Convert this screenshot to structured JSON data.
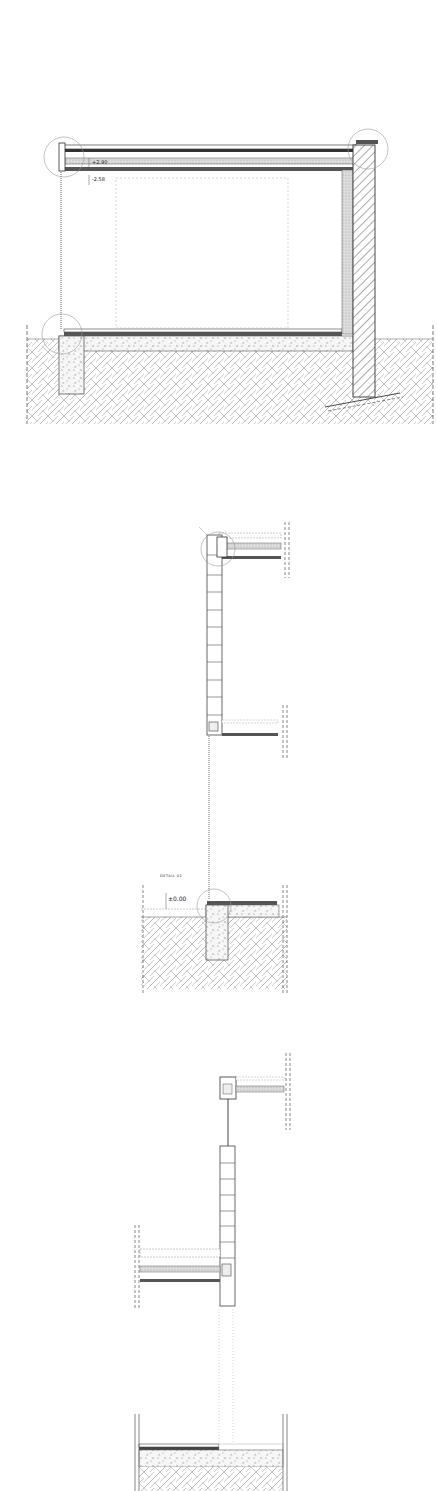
{
  "drawing": {
    "type": "architectural-section",
    "sections": [
      {
        "id": "overall-section",
        "labels": {
          "elev_top": "+2.90",
          "elev_ceiling": "-2.58"
        }
      },
      {
        "id": "detail-wall-top-to-base",
        "labels": {
          "title": "DETAIL 01",
          "elev_ground": "±0.00"
        }
      },
      {
        "id": "detail-wall-alt"
      }
    ],
    "colors": {
      "line": "#333333",
      "hatch": "#777777",
      "light": "#bbbbbb",
      "bg": "#ffffff"
    }
  }
}
